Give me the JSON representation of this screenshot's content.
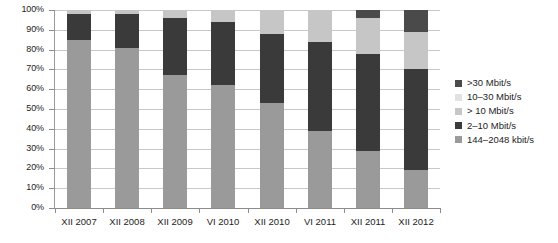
{
  "chart_data": {
    "type": "bar",
    "subtype": "stacked-bar-100pct",
    "title": "",
    "xlabel": "",
    "ylabel": "",
    "ylim": [
      0,
      100
    ],
    "ytick_labels": [
      "0%",
      "10%",
      "20%",
      "30%",
      "40%",
      "50%",
      "60%",
      "70%",
      "80%",
      "90%",
      "100%"
    ],
    "ytick_values": [
      0,
      10,
      20,
      30,
      40,
      50,
      60,
      70,
      80,
      90,
      100
    ],
    "grid": true,
    "legend_position": "right",
    "categories": [
      "XII 2007",
      "XII 2008",
      "XII 2009",
      "VI 2010",
      "XII 2010",
      "VI 2011",
      "XII 2011",
      "XII 2012"
    ],
    "series": [
      {
        "name": "144–2048 kbit/s",
        "color": "#9a9a9a",
        "values": [
          85,
          81,
          67,
          62,
          53,
          39,
          29,
          19
        ]
      },
      {
        "name": "2–10 Mbit/s",
        "color": "#3a3a3a",
        "values": [
          13,
          17,
          29,
          32,
          35,
          45,
          49,
          51
        ]
      },
      {
        "name": "> 10 Mbit/s",
        "color": "#c6c6c6",
        "values": [
          2,
          2,
          4,
          6,
          12,
          16,
          18,
          19
        ]
      },
      {
        "name": "10–30 Mbit/s",
        "color": "#e2e2e2",
        "values": [
          0,
          0,
          0,
          0,
          0,
          0,
          0,
          0
        ]
      },
      {
        "name": ">30 Mbit/s",
        "color": "#4a4a4a",
        "values": [
          0,
          0,
          0,
          0,
          0,
          0,
          4,
          11
        ]
      }
    ]
  },
  "legend": {
    "items": [
      {
        "label": ">30 Mbit/s",
        "color": "#4a4a4a"
      },
      {
        "label": "10–30 Mbit/s",
        "color": "#e2e2e2"
      },
      {
        "label": "> 10 Mbit/s",
        "color": "#c6c6c6"
      },
      {
        "label": "2–10 Mbit/s",
        "color": "#3a3a3a"
      },
      {
        "label": "144–2048 kbit/s",
        "color": "#9a9a9a"
      }
    ]
  },
  "axis": {
    "gridline_color": "#c9c9c9",
    "axis_color": "#8d8d8d",
    "text_color": "#1d1d1d"
  }
}
